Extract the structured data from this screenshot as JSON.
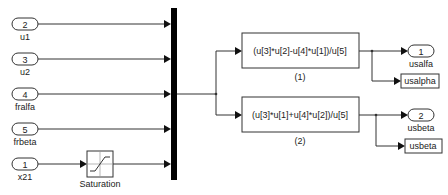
{
  "diagram": {
    "type": "simulink-block-diagram",
    "inports": [
      {
        "number": "2",
        "label": "u1"
      },
      {
        "number": "3",
        "label": "u2"
      },
      {
        "number": "4",
        "label": "fralfa"
      },
      {
        "number": "5",
        "label": "frbeta"
      },
      {
        "number": "1",
        "label": "x21"
      }
    ],
    "saturation": {
      "label": "Saturation"
    },
    "mux": {
      "inputs": 5
    },
    "fcn_blocks": [
      {
        "expression": "(u[3]*u[2]-u[4]*u[1])/u[5]",
        "label": "(1)"
      },
      {
        "expression": "(u[3]*u[1]+u[4]*u[2])/u[5]",
        "label": "(2)"
      }
    ],
    "outports": [
      {
        "number": "1",
        "label": "usalfa"
      },
      {
        "number": "2",
        "label": "usbeta"
      }
    ],
    "goto_tags": [
      {
        "tag": "usalpha"
      },
      {
        "tag": "usbeta"
      }
    ],
    "colors": {
      "line": "#333333",
      "mux": "#000000",
      "background": "#ffffff"
    }
  }
}
